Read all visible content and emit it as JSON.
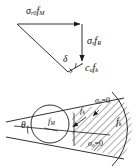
{
  "figure": {
    "background_color": "#ffffff",
    "stroke_color": "#1a1a1a",
    "panels": [
      {
        "name": "force-triangle",
        "description": "Upper force triangle with vector arrows"
      },
      {
        "name": "failure-wedge",
        "description": "Lower plan view with circular opening, hatched wedge and arc"
      }
    ]
  },
  "labels": {
    "sigma_r0_fM": {
      "sigma": "σ",
      "sigma_sub": "r0",
      "f": "f",
      "f_sub": "M"
    },
    "sigma_s_fR": {
      "sigma": "σ",
      "sigma_sub": "s",
      "f": "f",
      "f_sub": "R"
    },
    "cu_fk": {
      "c": "c",
      "c_sub": "u",
      "f": "f",
      "f_sub": "k"
    },
    "delta": "δ",
    "theta": "θ",
    "fM": {
      "f": "f",
      "f_sub": "M"
    },
    "fk_upper": {
      "f": "f",
      "f_sub": "k"
    },
    "fk_right": {
      "f": "f",
      "f_sub": "k"
    },
    "sigma_theta_zero_top": {
      "sigma": "σ",
      "sigma_sub": "θ",
      "eq": "=0"
    },
    "sigma_theta_zero_bottom": {
      "sigma": "σ",
      "sigma_sub": "θ",
      "eq": "=0"
    }
  },
  "geometry": {
    "triangle": {
      "left_vertex": [
        17,
        24
      ],
      "top_right_vertex": [
        82,
        24
      ],
      "bottom_vertex": [
        68,
        72
      ],
      "top_arrow_direction": "right",
      "right_arrow_direction": "down",
      "angle_marked": "delta",
      "right_angle_mark": true
    },
    "wedge": {
      "apex": [
        10,
        128
      ],
      "circle_center": [
        50,
        124
      ],
      "circle_radius": 19,
      "hatched": true,
      "hatch_angle_deg": 45,
      "arc_side": "right"
    }
  }
}
